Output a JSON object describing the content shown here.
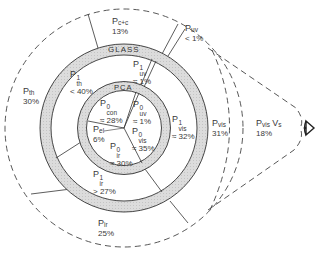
{
  "diagram": {
    "ring_labels": {
      "glass": "GLASS",
      "pca": "PCA"
    },
    "inner_core": [
      {
        "id": "con",
        "symbol": "P",
        "sup": "0",
        "sub": "con",
        "value": "≈ 28%"
      },
      {
        "id": "uv0",
        "symbol": "P",
        "sup": "0",
        "sub": "uv",
        "value": "≈ 1%"
      },
      {
        "id": "vis0",
        "symbol": "P",
        "sup": "0",
        "sub": "vis",
        "value": "≈ 35%"
      },
      {
        "id": "ir0",
        "symbol": "P",
        "sup": "0",
        "sub": "ir",
        "value": "≈ 30%"
      },
      {
        "id": "el",
        "symbol": "P",
        "sub": "el",
        "value": "6%"
      }
    ],
    "middle_ring": [
      {
        "id": "th1",
        "symbol": "P",
        "sup": "1",
        "sub": "th",
        "value": "< 40%"
      },
      {
        "id": "uv1",
        "symbol": "P",
        "sup": "1",
        "sub": "uv",
        "value": "≈ 1%"
      },
      {
        "id": "vis1",
        "symbol": "P",
        "sup": "1",
        "sub": "vis",
        "value": "≈ 32%"
      },
      {
        "id": "ir1",
        "symbol": "P",
        "sup": "1",
        "sub": "ir",
        "value": "> 27%"
      }
    ],
    "outer_ring": [
      {
        "id": "cc",
        "symbol": "P",
        "sub": "c+c",
        "value": "13%"
      },
      {
        "id": "uv",
        "symbol": "P",
        "sub": "uv",
        "value": "< 1%"
      },
      {
        "id": "th",
        "symbol": "P",
        "sub": "th",
        "value": "30%"
      },
      {
        "id": "vis",
        "symbol": "P",
        "sub": "vis",
        "value": "31%"
      },
      {
        "id": "ir",
        "symbol": "P",
        "sub": "ir",
        "value": "25%"
      }
    ],
    "eye_region": {
      "symbol": "P",
      "sub": "vis",
      "suffix": "V",
      "suffix_sub": "s",
      "value": "18%"
    },
    "icons": {
      "eye": "eye-icon"
    },
    "colors": {
      "ring_fill": "#d6d6d6",
      "line": "#333333",
      "text": "#3a3a3a"
    }
  }
}
